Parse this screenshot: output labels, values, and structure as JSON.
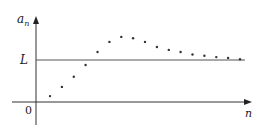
{
  "chart_data": {
    "type": "scatter",
    "title": "",
    "xlabel": "n",
    "ylabel": "a_n",
    "ylabel_main": "a",
    "ylabel_sub": "n",
    "origin_label": "0",
    "reference_line": {
      "label": "L",
      "value": 1.0
    },
    "grid": false,
    "legend": null,
    "xlim": [
      0,
      18
    ],
    "ylim": [
      -0.5,
      2.0
    ],
    "x": [
      1,
      2,
      3,
      4,
      5,
      6,
      7,
      8,
      9,
      10,
      11,
      12,
      13,
      14,
      15,
      16,
      17
    ],
    "values": [
      0.14,
      0.36,
      0.6,
      0.88,
      1.19,
      1.43,
      1.55,
      1.52,
      1.43,
      1.31,
      1.24,
      1.19,
      1.13,
      1.1,
      1.07,
      1.05,
      1.02
    ],
    "annotation": "Sequence a_n rises above L, peaks, then decreases toward the limit L"
  },
  "colors": {
    "axis": "#333333",
    "points": "#333333",
    "reference_line": "#555555"
  }
}
